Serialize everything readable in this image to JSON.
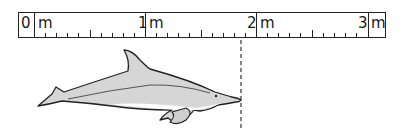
{
  "ruler": {
    "units": "m",
    "labels": [
      {
        "num": "0",
        "unit": "m"
      },
      {
        "num": "1",
        "unit": "m"
      },
      {
        "num": "2",
        "unit": "m"
      },
      {
        "num": "3",
        "unit": "m"
      }
    ],
    "range_m": [
      0,
      3
    ],
    "minor_ticks_per_meter": 10
  },
  "figure": {
    "length_marker_m": 2.0,
    "colors": {
      "outline": "#222222",
      "body": "#d6d6d6",
      "belly": "#ffffff",
      "marker": "#333333"
    }
  }
}
